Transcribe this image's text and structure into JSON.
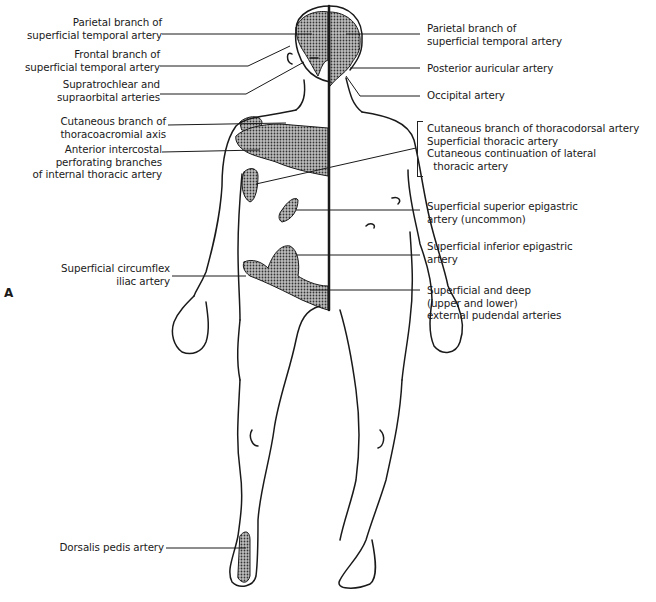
{
  "figure": {
    "panel_label": "A",
    "colors": {
      "line": "#1a1a1a",
      "shade": "#555555",
      "background": "#ffffff"
    }
  },
  "labels_left": [
    {
      "lines": [
        "Parietal branch of",
        "superficial temporal artery"
      ]
    },
    {
      "lines": [
        "Frontal branch of",
        "superficial temporal artery"
      ]
    },
    {
      "lines": [
        "Supratrochlear and",
        "supraorbital arteries"
      ]
    },
    {
      "lines": [
        "Cutaneous branch of",
        "thoracoacromial axis"
      ]
    },
    {
      "lines": [
        "Anterior intercostal",
        "perforating branches",
        "of internal thoracic artery"
      ]
    },
    {
      "lines": [
        "Superficial circumflex",
        "iliac artery"
      ]
    },
    {
      "lines": [
        "Dorsalis pedis artery"
      ]
    }
  ],
  "labels_right": [
    {
      "lines": [
        "Parietal branch of",
        "superficial temporal artery"
      ]
    },
    {
      "lines": [
        "Posterior auricular artery"
      ]
    },
    {
      "lines": [
        "Occipital artery"
      ]
    },
    {
      "lines": [
        "Cutaneous branch of thoracodorsal artery",
        "Superficial thoracic artery",
        "Cutaneous continuation of lateral",
        "  thoracic artery"
      ]
    },
    {
      "lines": [
        "Superficial superior epigastric",
        "artery (uncommon)"
      ]
    },
    {
      "lines": [
        "Superficial inferior epigastric",
        "artery"
      ]
    },
    {
      "lines": [
        "Superficial and deep",
        "(upper and lower)",
        "external pudendal arteries"
      ]
    }
  ]
}
